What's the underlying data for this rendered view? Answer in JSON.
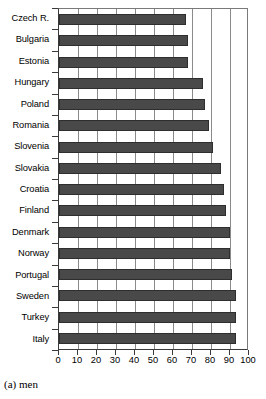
{
  "caption": "(a) men",
  "chart_data": {
    "type": "bar",
    "orientation": "horizontal",
    "title": "",
    "subtitle": "",
    "xlabel": "",
    "ylabel": "",
    "xlim": [
      0,
      100
    ],
    "xticks": [
      0,
      10,
      20,
      30,
      40,
      50,
      60,
      70,
      80,
      90,
      100
    ],
    "xticklabels": [
      "0",
      "10",
      "20",
      "30",
      "40",
      "50",
      "60",
      "70",
      "80",
      "90",
      "100"
    ],
    "grid": "vertical",
    "legend": "none",
    "bar_color": "#494949",
    "categories": [
      "Czech R.",
      "Bulgaria",
      "Estonia",
      "Hungary",
      "Poland",
      "Romania",
      "Slovenia",
      "Slovakia",
      "Croatia",
      "Finland",
      "Denmark",
      "Norway",
      "Portugal",
      "Sweden",
      "Turkey",
      "Italy"
    ],
    "values": [
      67,
      68,
      68,
      76,
      77,
      79,
      81,
      85,
      87,
      88,
      90,
      90,
      91,
      93,
      93,
      93
    ]
  }
}
